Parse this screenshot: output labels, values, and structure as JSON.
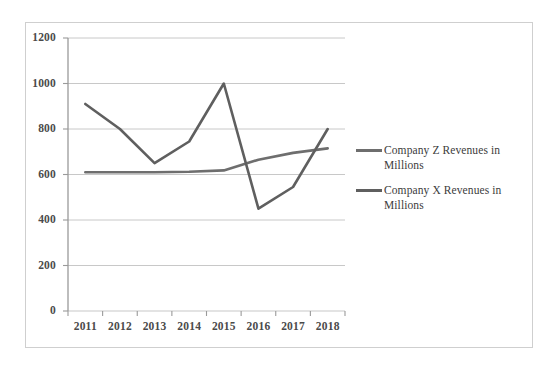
{
  "chart_data": {
    "type": "line",
    "title": "",
    "xlabel": "",
    "ylabel": "",
    "categories": [
      "2011",
      "2012",
      "2013",
      "2014",
      "2015",
      "2016",
      "2017",
      "2018"
    ],
    "x": [
      2011,
      2012,
      2013,
      2014,
      2015,
      2016,
      2017,
      2018
    ],
    "series": [
      {
        "name": "Company Z Revenues in Millions",
        "color": "#6e6e6e",
        "values": [
          610,
          610,
          610,
          612,
          618,
          665,
          695,
          715
        ]
      },
      {
        "name": "Company X Revenues in Millions",
        "color": "#5f5f5f",
        "values": [
          910,
          800,
          650,
          745,
          1000,
          450,
          545,
          800
        ]
      }
    ],
    "ylim": [
      0,
      1200
    ],
    "yticks": [
      0,
      200,
      400,
      600,
      800,
      1000,
      1200
    ],
    "ytick_labels": [
      "0",
      "200",
      "400",
      "600",
      "800",
      "1000",
      "1200"
    ],
    "xtick_labels": [
      "2011",
      "2012",
      "2013",
      "2014",
      "2015",
      "2016",
      "2017",
      "2018"
    ],
    "grid": true,
    "grid_axis": "y",
    "legend_position": "right",
    "legend": [
      "Company Z Revenues in Millions",
      "Company X Revenues in Millions"
    ]
  },
  "colors": {
    "grid": "#c8c8c8",
    "axis": "#9a9a9a",
    "frame": "#cfcfcf",
    "background": "#ffffff",
    "tick_text": "#4a4a4a",
    "legend_text": "#3c3c3c",
    "series_z": "#6e6e6e",
    "series_x": "#5f5f5f"
  },
  "legend": {
    "entries": [
      {
        "label": "Company Z Revenues in Millions"
      },
      {
        "label": "Company X Revenues in Millions"
      }
    ]
  }
}
